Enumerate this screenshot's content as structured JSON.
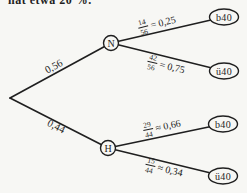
{
  "page": {
    "background": "#f7f7f4",
    "ink": "#1f1f1f"
  },
  "header": {
    "clipped_line": "hat etwa 20 %."
  },
  "tree": {
    "stage1": [
      {
        "probability": "0,56",
        "node": "N"
      },
      {
        "probability": "0,44",
        "node": "H"
      }
    ],
    "branches": [
      {
        "from": "N",
        "numerator": "14",
        "denominator": "56",
        "suffix": "= 0,25",
        "leaf": "b40"
      },
      {
        "from": "N",
        "numerator": "42",
        "denominator": "56",
        "suffix": "= 0,75",
        "leaf": "ü40"
      },
      {
        "from": "H",
        "numerator": "29",
        "denominator": "44",
        "suffix": "≈ 0,66",
        "leaf": "b40"
      },
      {
        "from": "H",
        "numerator": "15",
        "denominator": "44",
        "suffix": "≈ 0,34",
        "leaf": "ü40"
      }
    ]
  }
}
